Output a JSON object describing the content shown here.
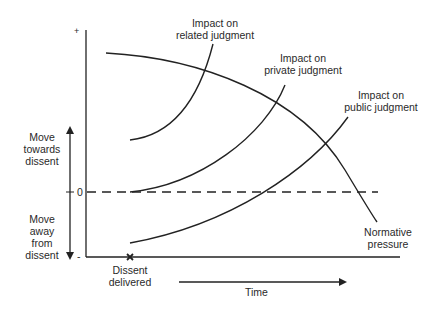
{
  "diagram": {
    "title": "",
    "y_axis": {
      "top_label": "+",
      "zero_label": "0",
      "bottom_label": "-",
      "up_arrow_label": [
        "Move",
        "towards",
        "dissent"
      ],
      "down_arrow_label": [
        "Move",
        "away",
        "from",
        "dissent"
      ]
    },
    "x_axis": {
      "event_marker": "×",
      "event_label": [
        "Dissent",
        "delivered"
      ],
      "time_label": "Time"
    },
    "curves": [
      {
        "name": "Impact on related judgment",
        "label": [
          "Impact on",
          "related judgment"
        ]
      },
      {
        "name": "Impact on private judgment",
        "label": [
          "Impact on",
          "private judgment"
        ]
      },
      {
        "name": "Impact on public judgment",
        "label": [
          "Impact on",
          "public judgment"
        ]
      },
      {
        "name": "Normative pressure",
        "label": [
          "Normative",
          "pressure"
        ]
      }
    ],
    "line_color": "#222222",
    "background": "#ffffff"
  }
}
